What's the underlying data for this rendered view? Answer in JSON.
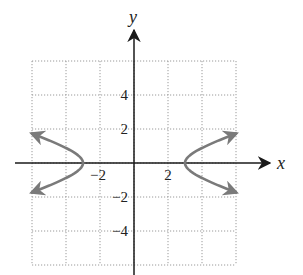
{
  "chart_data": {
    "type": "line",
    "title": "",
    "equation": "x^2/9 - y^2 = 1",
    "xlabel": "x",
    "ylabel": "y",
    "xlim": [
      -6,
      6
    ],
    "ylim": [
      -6,
      6
    ],
    "grid": true,
    "grid_step": 2,
    "x_ticks": [
      {
        "value": -2,
        "label": "−2"
      },
      {
        "value": 2,
        "label": "2"
      }
    ],
    "y_ticks": [
      {
        "value": 4,
        "label": "4"
      },
      {
        "value": 2,
        "label": "2"
      },
      {
        "value": -2,
        "label": "−2"
      },
      {
        "value": -4,
        "label": "−4"
      }
    ],
    "series": [
      {
        "name": "right branch",
        "x": [
          6,
          5,
          4,
          3.5,
          3.2,
          3,
          3.2,
          3.5,
          4,
          5,
          6
        ],
        "y": [
          1.73,
          1.33,
          0.88,
          0.6,
          0.37,
          0,
          -0.37,
          -0.6,
          -0.88,
          -1.33,
          -1.73
        ]
      },
      {
        "name": "left branch",
        "x": [
          -6,
          -5,
          -4,
          -3.5,
          -3.2,
          -3,
          -3.2,
          -3.5,
          -4,
          -5,
          -6
        ],
        "y": [
          1.73,
          1.33,
          0.88,
          0.6,
          0.37,
          0,
          -0.37,
          -0.6,
          -0.88,
          -1.33,
          -1.73
        ]
      }
    ],
    "vertices": [
      [
        -3,
        0
      ],
      [
        3,
        0
      ]
    ],
    "curve_color": "#7a7a7a",
    "axis_color": "#1a1a1a",
    "grid_color": "#9a9a9a"
  },
  "labels": {
    "x_axis": "x",
    "y_axis": "y"
  }
}
